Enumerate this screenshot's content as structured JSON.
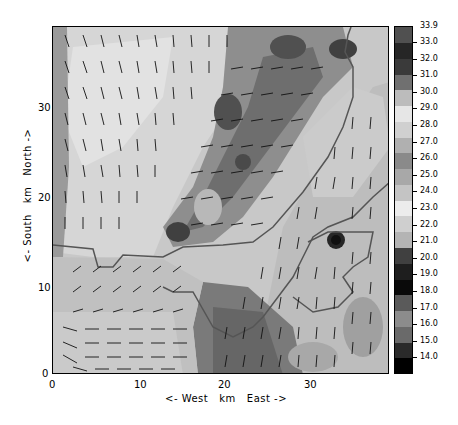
{
  "chart_data": {
    "type": "heatmap",
    "subtype": "filled contour map with wind vector arrows and coastline overlay",
    "title": "",
    "units_label_partial": "(clipped at top)",
    "xlabel": "<- West   km   East ->",
    "ylabel": "<- South   km   North ->",
    "xlim": [
      0,
      39
    ],
    "ylim": [
      0,
      39
    ],
    "x_ticks": [
      0,
      10,
      20,
      30
    ],
    "y_ticks": [
      0,
      10,
      20,
      30
    ],
    "grid": false,
    "colorbar": {
      "position": "right",
      "levels": [
        "14.0",
        "15.0",
        "16.0",
        "17.0",
        "18.0",
        "19.0",
        "20.0",
        "21.0",
        "22.0",
        "23.0",
        "24.0",
        "25.0",
        "26.0",
        "27.0",
        "28.0",
        "29.0",
        "30.0",
        "31.0",
        "32.0",
        "33.0",
        "33.9"
      ],
      "colors": [
        "#000000",
        "#2a2a2a",
        "#6a6a6a",
        "#8c8c8c",
        "#5a5a5a",
        "#0a0a0a",
        "#1e1e1e",
        "#404040",
        "#b4b4b4",
        "#cfcfcf",
        "#ececec",
        "#c4c4c4",
        "#a8a8a8",
        "#8a8a8a",
        "#b0b0b0",
        "#d0d0d0",
        "#e6e6e6",
        "#bcbcbc",
        "#707070",
        "#3a3a3a",
        "#262626",
        "#505050"
      ]
    },
    "regions": [
      {
        "name": "northwest land (warm, light)",
        "approx_value": 28
      },
      {
        "name": "central diagonal dark band",
        "approx_value": 31
      },
      {
        "name": "southeast sea/land (light gray)",
        "approx_value": 26
      },
      {
        "name": "southwest low area",
        "approx_value": 25
      },
      {
        "name": "south-central dark patch",
        "approx_value": 30.5
      },
      {
        "name": "hot spot near (32,15)",
        "approx_value": 33
      }
    ],
    "vector_field": {
      "north_half": "predominantly southward / south-southeast flow",
      "central_band": "westward flow",
      "southwest_corner": "eastward flow along y=0-5 km",
      "southeast": "southward flow"
    }
  },
  "axes": {
    "x_tick_labels": [
      "0",
      "10",
      "20",
      "30"
    ],
    "y_tick_labels": [
      "0",
      "10",
      "20",
      "30"
    ],
    "xlabel": "<- West   km   East ->",
    "ylabel": "<- South   km   North ->"
  },
  "colorbar": {
    "labels": [
      "33.9",
      "33.0",
      "32.0",
      "31.0",
      "30.0",
      "29.0",
      "28.0",
      "27.0",
      "26.0",
      "25.0",
      "24.0",
      "23.0",
      "22.0",
      "21.0",
      "20.0",
      "19.0",
      "18.0",
      "17.0",
      "16.0",
      "15.0",
      "14.0"
    ],
    "segment_colors_top_to_bottom": [
      "#505050",
      "#262626",
      "#3a3a3a",
      "#707070",
      "#bcbcbc",
      "#e6e6e6",
      "#d0d0d0",
      "#b0b0b0",
      "#8a8a8a",
      "#a8a8a8",
      "#c4c4c4",
      "#ececec",
      "#cfcfcf",
      "#b4b4b4",
      "#404040",
      "#1e1e1e",
      "#0a0a0a",
      "#5a5a5a",
      "#8c8c8c",
      "#6a6a6a",
      "#2a2a2a",
      "#000000"
    ]
  }
}
